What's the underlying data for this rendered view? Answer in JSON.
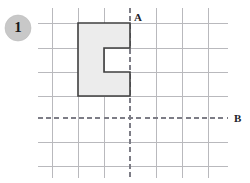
{
  "figure": {
    "problem_number": "1",
    "badge_icon": "numbered-circle-badge",
    "labels": {
      "vertical_mirror": "A",
      "horizontal_mirror": "B"
    },
    "colors": {
      "grid": "#b9b9bd",
      "mirror": "#7d7d86",
      "shape_fill": "#ececec",
      "shape_stroke": "#3f3f3f",
      "badge_fill": "#c8c8c8",
      "label_text": "#22222a"
    },
    "grid": {
      "cell_width": 26,
      "cell_height": 24,
      "x_positions": [
        52,
        78,
        104,
        130,
        156,
        182,
        208
      ],
      "y_positions": [
        23,
        48,
        72,
        96,
        118,
        142,
        166
      ],
      "x_extent": [
        38,
        228
      ],
      "y_extent": [
        8,
        178
      ]
    },
    "mirror_lines": {
      "vertical_x": 130,
      "horizontal_y": 118
    },
    "shape": {
      "name": "c-shaped-polygon",
      "outer": {
        "left": 78,
        "top": 23,
        "right": 130,
        "bottom": 96
      },
      "notch": {
        "left": 104,
        "top": 48,
        "right": 130,
        "bottom": 72
      },
      "points": "78,23 130,23 130,48 104,48 104,72 130,72 130,96 78,96"
    },
    "badge": {
      "cx": 18,
      "cy": 28,
      "r": 13
    },
    "label_positions": {
      "a": {
        "x": 134,
        "y": 21
      },
      "b": {
        "x": 234,
        "y": 122
      }
    }
  }
}
